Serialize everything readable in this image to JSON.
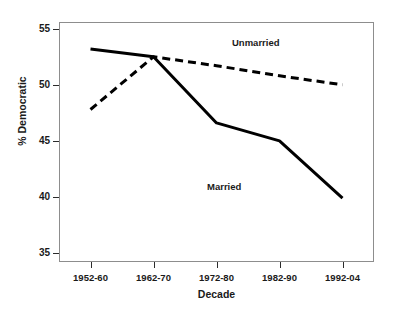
{
  "chart_data": {
    "type": "line",
    "title": "",
    "xlabel": "Decade",
    "ylabel": "% Democratic",
    "categories": [
      "1952-60",
      "1962-70",
      "1972-80",
      "1982-90",
      "1992-04"
    ],
    "series": [
      {
        "name": "Married",
        "style": "solid",
        "color": "#000000",
        "values": [
          53.2,
          52.5,
          46.6,
          45.0,
          39.9
        ]
      },
      {
        "name": "Unmarried",
        "style": "dashed",
        "color": "#000000",
        "values": [
          47.8,
          52.5,
          51.7,
          50.8,
          50.0
        ]
      }
    ],
    "ylim": [
      34.2,
      55.6
    ],
    "yticks": [
      35,
      40,
      45,
      50,
      55
    ],
    "ytick_labels": [
      "35",
      "40",
      "45",
      "50",
      "55"
    ],
    "grid": false,
    "legend": "inline-annotations",
    "annotations": [
      {
        "text": "Unmarried",
        "series": "Unmarried"
      },
      {
        "text": "Married",
        "series": "Married"
      }
    ]
  },
  "axes": {
    "y_title": "% Democratic",
    "x_title": "Decade"
  }
}
